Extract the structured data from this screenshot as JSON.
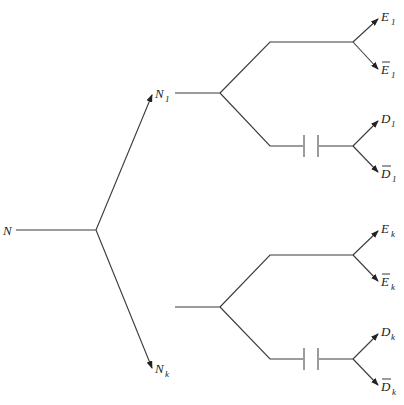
{
  "diagram": {
    "type": "branching-tree",
    "root": {
      "label": "N",
      "sub": ""
    },
    "level1": [
      {
        "label": "N",
        "sub": "1"
      },
      {
        "label": "N",
        "sub": "k"
      }
    ],
    "leaves": [
      {
        "label": "E",
        "sub": "1",
        "overline": false
      },
      {
        "label": "E",
        "sub": "1",
        "overline": true
      },
      {
        "label": "D",
        "sub": "1",
        "overline": false
      },
      {
        "label": "D",
        "sub": "1",
        "overline": true
      },
      {
        "label": "E",
        "sub": "k",
        "overline": false
      },
      {
        "label": "E",
        "sub": "k",
        "overline": true
      },
      {
        "label": "D",
        "sub": "k",
        "overline": false
      },
      {
        "label": "D",
        "sub": "k",
        "overline": true
      }
    ],
    "elements": {
      "capacitor_count": 2,
      "line_color": "#3a3a3a"
    }
  }
}
